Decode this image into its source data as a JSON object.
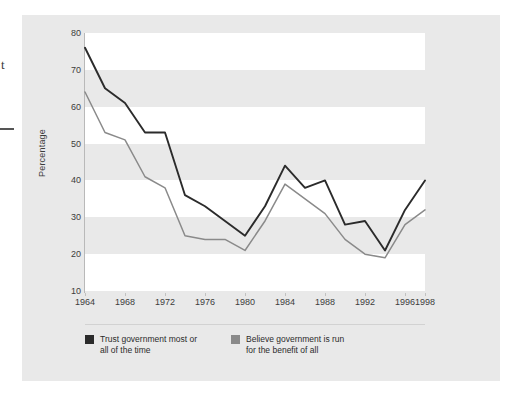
{
  "figure": {
    "artifacts": {
      "stray_letter": "t"
    }
  },
  "axes": {
    "y_title": "Percentage",
    "y_ticks": [
      80,
      70,
      60,
      50,
      40,
      30,
      20,
      10
    ],
    "x_ticks": [
      1964,
      1968,
      1972,
      1976,
      1980,
      1984,
      1988,
      1992,
      1996,
      1998
    ]
  },
  "legend": {
    "entries": [
      {
        "label": "Trust government most or\nall of the time",
        "color": "#2b2b2b"
      },
      {
        "label": "Believe government is run\nfor the benefit of all",
        "color": "#8a8a8a"
      }
    ]
  },
  "chart_data": {
    "type": "line",
    "title": "",
    "subtitle": "",
    "xlabel": "",
    "ylabel": "Percentage",
    "xlim": [
      1964,
      1998
    ],
    "ylim": [
      10,
      80
    ],
    "y_tick_step": 10,
    "grid": "horizontal-alternating-bands",
    "legend_position": "bottom-left",
    "x": [
      1964,
      1966,
      1968,
      1970,
      1972,
      1974,
      1976,
      1978,
      1980,
      1982,
      1984,
      1986,
      1988,
      1990,
      1992,
      1994,
      1996,
      1998
    ],
    "series": [
      {
        "name": "Trust government most or all of the time",
        "color": "#2b2b2b",
        "values": [
          76,
          65,
          61,
          53,
          53,
          36,
          33,
          29,
          25,
          33,
          44,
          38,
          40,
          28,
          29,
          21,
          32,
          40
        ]
      },
      {
        "name": "Believe government is run for the benefit of all",
        "color": "#8a8a8a",
        "values": [
          64,
          53,
          51,
          41,
          38,
          25,
          24,
          24,
          21,
          29,
          39,
          35,
          31,
          24,
          20,
          19,
          28,
          32
        ]
      }
    ]
  }
}
